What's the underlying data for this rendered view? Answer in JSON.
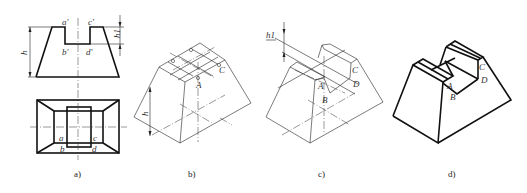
{
  "figure": {
    "panels": [
      {
        "id": "a",
        "caption": "a)",
        "type": "orthographic-views",
        "front_view_labels": [
          "a'",
          "c'",
          "b'",
          "d'"
        ],
        "top_view_labels": [
          "a",
          "c",
          "b",
          "d"
        ],
        "dimensions": [
          "h",
          "h1"
        ]
      },
      {
        "id": "b",
        "caption": "b)",
        "type": "isometric-construction-step",
        "point_labels": [
          "A",
          "C"
        ],
        "dimensions": [
          "h"
        ]
      },
      {
        "id": "c",
        "caption": "c)",
        "type": "isometric-construction-step",
        "point_labels": [
          "A",
          "B",
          "C",
          "D"
        ],
        "dimensions": [
          "h1"
        ]
      },
      {
        "id": "d",
        "caption": "d)",
        "type": "isometric-final",
        "point_labels": [
          "A",
          "B",
          "C",
          "D"
        ]
      }
    ]
  },
  "labels": {
    "a_front": {
      "a_p": "a'",
      "c_p": "c'",
      "b_p": "b'",
      "d_p": "d'",
      "h": "h",
      "h1": "h1"
    },
    "a_top": {
      "a": "a",
      "c": "c",
      "b": "b",
      "d": "d"
    },
    "b": {
      "A": "A",
      "C": "C",
      "h": "h"
    },
    "c": {
      "A": "A",
      "B": "B",
      "C": "C",
      "D": "D",
      "h1": "h1"
    },
    "d": {
      "A": "A",
      "B": "B",
      "C": "C",
      "D": "D"
    }
  },
  "captions": {
    "a": "a)",
    "b": "b)",
    "c": "c)",
    "d": "d)"
  }
}
